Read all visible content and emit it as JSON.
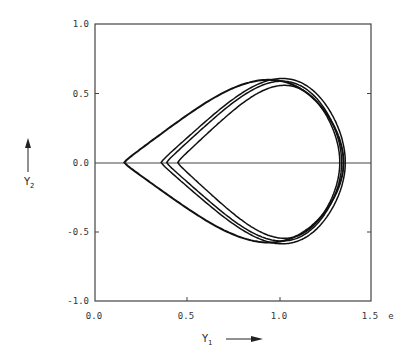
{
  "chart_data": {
    "type": "line",
    "title": "",
    "xlabel": "Y1",
    "ylabel": "Y2",
    "x_extra_label": "e",
    "xlim": [
      0.0,
      1.5
    ],
    "ylim": [
      -1.0,
      1.0
    ],
    "x_ticks": [
      "0.0",
      "0.5",
      "1.0",
      "1.5"
    ],
    "y_ticks": [
      "1.0",
      "0.5",
      "0.0",
      "-0.5",
      "-1.0"
    ],
    "grid": false,
    "reference_lines": [
      {
        "orientation": "horizontal",
        "y": 0.0
      }
    ],
    "series": [
      {
        "name": "loop-outer",
        "left_x": 0.16,
        "right_x": 1.35,
        "top_y": 0.6,
        "bottom_y": -0.58,
        "peak_x": 0.93
      },
      {
        "name": "loop-2",
        "left_x": 0.36,
        "right_x": 1.36,
        "top_y": 0.61,
        "bottom_y": -0.59,
        "peak_x": 0.96
      },
      {
        "name": "loop-3",
        "left_x": 0.39,
        "right_x": 1.34,
        "top_y": 0.59,
        "bottom_y": -0.57,
        "peak_x": 0.98
      },
      {
        "name": "loop-4",
        "left_x": 0.45,
        "right_x": 1.33,
        "top_y": 0.56,
        "bottom_y": -0.55,
        "peak_x": 1.0
      }
    ]
  },
  "labels": {
    "y_axis": "Y",
    "y_axis_sub": "2",
    "x_axis": "Y",
    "x_axis_sub": "1",
    "x_extra": "e",
    "tick_x0": "0.0",
    "tick_x1": "0.5",
    "tick_x2": "1.0",
    "tick_x3": "1.5",
    "tick_y0": "1.0",
    "tick_y1": "0.5",
    "tick_y2": "0.0",
    "tick_y3": "-0.5",
    "tick_y4": "-1.0"
  }
}
